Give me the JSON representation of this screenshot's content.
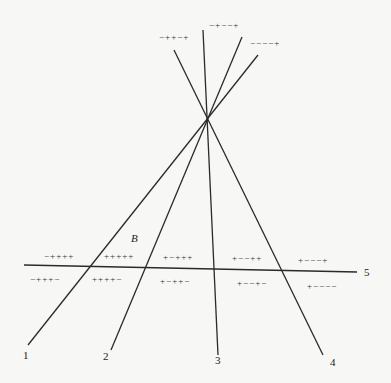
{
  "diagram": {
    "line_labels": [
      "1",
      "2",
      "3",
      "4",
      "5"
    ],
    "region_label": "B",
    "top_labels": [
      "−++−+",
      "−+−−+",
      "−−−−+"
    ],
    "upper_row_labels": [
      "−++++",
      "+++++",
      "+−+++",
      "+−−++",
      "+−−−+"
    ],
    "lower_row_labels": [
      "−+++−",
      "++++−",
      "+−++−",
      "+−−+−",
      "+−−−−"
    ],
    "colors": {
      "line": "#2a2a2a",
      "background": "#f7f7f5"
    }
  }
}
